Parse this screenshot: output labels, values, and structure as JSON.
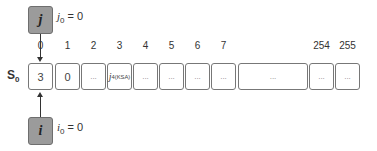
{
  "pointers": {
    "j": {
      "symbol": "j",
      "label_var": "j",
      "label_sub": "0",
      "label_rest": " = 0"
    },
    "i": {
      "symbol": "i",
      "label_var": "i",
      "label_sub": "0",
      "label_rest": " = 0"
    }
  },
  "state": {
    "name": "S",
    "sub": "0"
  },
  "indices": [
    "0",
    "1",
    "2",
    "3",
    "4",
    "5",
    "6",
    "7",
    "254",
    "255"
  ],
  "cells": [
    {
      "value": "3"
    },
    {
      "value": "0"
    },
    {
      "value": "..."
    },
    {
      "var": "j",
      "sub": "4(KSA)"
    },
    {
      "value": "..."
    },
    {
      "value": "..."
    },
    {
      "value": "..."
    },
    {
      "value": "..."
    },
    {
      "value": "..."
    },
    {
      "value": "..."
    },
    {
      "value": "..."
    }
  ],
  "colors": {
    "pointer_fill": "#9b9b9b",
    "pointer_border": "#6e6e6e",
    "cell_border": "#777777"
  }
}
